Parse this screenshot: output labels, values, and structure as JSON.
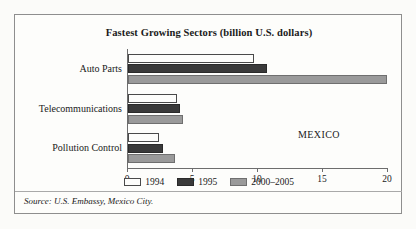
{
  "frame": {
    "source_note": "Source: U.S. Embassy, Mexico City."
  },
  "chart_data": {
    "type": "bar",
    "orientation": "horizontal",
    "title": "Fastest Growing Sectors (billion U.S. dollars)",
    "xlabel": "",
    "ylabel": "",
    "xlim": [
      0,
      20
    ],
    "xticks": [
      0,
      5,
      10,
      15,
      20
    ],
    "xtick_labels": [
      "0",
      "5",
      "10",
      "15",
      "20"
    ],
    "grid": false,
    "legend_position": "bottom-center",
    "annotation": "MEXICO",
    "categories": [
      "Auto Parts",
      "Telecommunications",
      "Pollution Control"
    ],
    "series": [
      {
        "name": "1994",
        "color": "#ffffff",
        "values": [
          9.7,
          3.8,
          2.4
        ]
      },
      {
        "name": "1995",
        "color": "#3a3a3a",
        "values": [
          10.7,
          4.0,
          2.7
        ]
      },
      {
        "name": "2000–2005",
        "color": "#9a9a9a",
        "values": [
          19.9,
          4.2,
          3.6
        ]
      }
    ]
  }
}
